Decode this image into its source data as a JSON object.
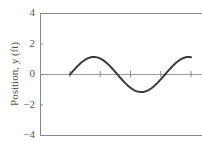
{
  "chart_data": {
    "type": "line",
    "title": "",
    "xlabel": "",
    "ylabel": "Position, y (ft)",
    "ylim": [
      -4,
      4
    ],
    "yticks": [
      4,
      2,
      0,
      -2,
      -4
    ],
    "ytick_labels": [
      "4",
      "2",
      "0",
      "−2",
      "−4"
    ],
    "xticks_on_zero_line": 5,
    "grid": false,
    "legend": null,
    "series": [
      {
        "name": "y(t)",
        "description": "sinusoid starting at 0, peaking near 1.15, trough near -1.1, ending near 1.15 (about 1.25 periods)",
        "amplitude": 1.15,
        "x_frac": [
          0.0,
          0.1,
          0.2,
          0.3,
          0.4,
          0.5,
          0.6,
          0.7,
          0.8,
          0.9,
          1.0
        ],
        "y": [
          0.0,
          0.82,
          1.14,
          0.55,
          -0.48,
          -1.12,
          -0.86,
          0.08,
          0.95,
          1.11,
          1.14
        ]
      }
    ],
    "colors": {
      "curve": "#3a3a3a",
      "axes": "#8a8a8a",
      "text": "#555555"
    }
  }
}
